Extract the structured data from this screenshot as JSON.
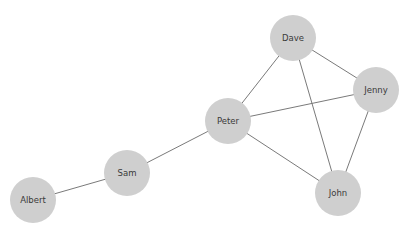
{
  "graph": {
    "nodes": [
      {
        "id": "dave",
        "label": "Dave",
        "x": 293,
        "y": 38
      },
      {
        "id": "jenny",
        "label": "Jenny",
        "x": 376,
        "y": 90
      },
      {
        "id": "peter",
        "label": "Peter",
        "x": 228,
        "y": 121
      },
      {
        "id": "sam",
        "label": "Sam",
        "x": 127,
        "y": 173
      },
      {
        "id": "john",
        "label": "John",
        "x": 338,
        "y": 193
      },
      {
        "id": "albert",
        "label": "Albert",
        "x": 33,
        "y": 200
      }
    ],
    "edges": [
      {
        "from": "albert",
        "to": "sam"
      },
      {
        "from": "sam",
        "to": "peter"
      },
      {
        "from": "peter",
        "to": "dave"
      },
      {
        "from": "peter",
        "to": "jenny"
      },
      {
        "from": "peter",
        "to": "john"
      },
      {
        "from": "dave",
        "to": "jenny"
      },
      {
        "from": "dave",
        "to": "john"
      },
      {
        "from": "jenny",
        "to": "john"
      }
    ],
    "colors": {
      "node": "#cfcfcf",
      "edge": "#7a7a7a",
      "label": "#3a3a3a"
    },
    "node_radius": 22
  }
}
